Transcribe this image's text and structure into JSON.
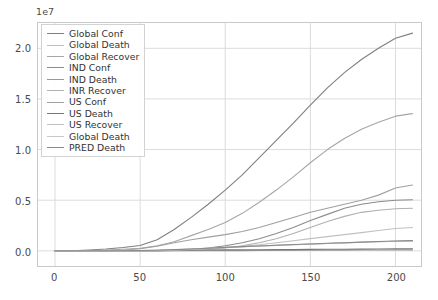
{
  "chart_data": {
    "type": "line",
    "title": "",
    "xlabel": "",
    "ylabel": "",
    "y_offset_label": "1e7",
    "y_offset_value": 10000000,
    "xlim": [
      -10,
      215
    ],
    "ylim": [
      -1500000,
      22500000
    ],
    "xticks": [
      0,
      50,
      100,
      150,
      200
    ],
    "yticks": [
      0.0,
      0.5,
      1.0,
      1.5,
      2.0
    ],
    "ytick_labels": [
      "0.0",
      "0.5",
      "1.0",
      "1.5",
      "2.0"
    ],
    "xtick_labels": [
      "0",
      "50",
      "100",
      "150",
      "200"
    ],
    "grid": true,
    "legend_position": "upper left",
    "x": [
      0,
      10,
      20,
      30,
      40,
      50,
      60,
      70,
      80,
      90,
      100,
      110,
      120,
      130,
      140,
      150,
      160,
      170,
      180,
      190,
      200,
      210
    ],
    "series": [
      {
        "name": "Global Conf",
        "color": "#7f7f7f",
        "values": [
          0,
          5000,
          80000,
          180000,
          320000,
          520000,
          1100000,
          2100000,
          3300000,
          4600000,
          6000000,
          7500000,
          9200000,
          10900000,
          12600000,
          14400000,
          16100000,
          17600000,
          18900000,
          20000000,
          21000000,
          21500000
        ]
      },
      {
        "name": "Global Death",
        "color": "#bdbdbd",
        "values": [
          0,
          200,
          2500,
          6000,
          12000,
          24000,
          55000,
          110000,
          175000,
          250000,
          330000,
          400000,
          470000,
          540000,
          600000,
          660000,
          720000,
          780000,
          840000,
          900000,
          950000,
          980000
        ]
      },
      {
        "name": "Global Recover",
        "color": "#a6a6a6",
        "values": [
          0,
          1000,
          25000,
          70000,
          150000,
          260000,
          500000,
          900000,
          1500000,
          2100000,
          2800000,
          3700000,
          4800000,
          6000000,
          7300000,
          8700000,
          10000000,
          11100000,
          12000000,
          12700000,
          13300000,
          13550000
        ]
      },
      {
        "name": "IND Conf",
        "color": "#8c8c8c",
        "values": [
          0,
          0,
          0,
          100,
          1000,
          5000,
          20000,
          60000,
          140000,
          280000,
          500000,
          800000,
          1200000,
          1700000,
          2300000,
          3000000,
          3600000,
          4200000,
          4600000,
          4850000,
          5000000,
          5050000
        ]
      },
      {
        "name": "IND Death",
        "color": "#999999",
        "values": [
          0,
          0,
          0,
          5,
          30,
          150,
          600,
          1800,
          4000,
          8000,
          15000,
          22000,
          30000,
          37000,
          45000,
          55000,
          63000,
          70000,
          76000,
          79000,
          81000,
          82000
        ]
      },
      {
        "name": "INR Recover",
        "color": "#b0b0b0",
        "values": [
          0,
          0,
          0,
          20,
          120,
          600,
          4000,
          18000,
          60000,
          140000,
          280000,
          500000,
          800000,
          1200000,
          1700000,
          2300000,
          2900000,
          3400000,
          3800000,
          4000000,
          4150000,
          4200000
        ]
      },
      {
        "name": "US Conf",
        "color": "#a0a0a0",
        "values": [
          0,
          0,
          100,
          3000,
          60000,
          200000,
          450000,
          800000,
          1100000,
          1350000,
          1600000,
          1900000,
          2300000,
          2800000,
          3300000,
          3800000,
          4200000,
          4600000,
          5000000,
          5500000,
          6200000,
          6500000
        ]
      },
      {
        "name": "US Death",
        "color": "#777777",
        "values": [
          0,
          0,
          2,
          70,
          900,
          5000,
          18000,
          40000,
          63000,
          78000,
          90000,
          100000,
          112000,
          125000,
          135000,
          145000,
          152000,
          160000,
          170000,
          180000,
          190000,
          195000
        ]
      },
      {
        "name": "US Recover",
        "color": "#c0c0c0",
        "values": [
          0,
          0,
          0,
          30,
          2000,
          10000,
          30000,
          70000,
          140000,
          220000,
          320000,
          450000,
          600000,
          800000,
          1000000,
          1200000,
          1400000,
          1600000,
          1800000,
          2000000,
          2200000,
          2300000
        ]
      },
      {
        "name": "Global Death",
        "color": "#c8c8c8",
        "values": [
          0,
          200,
          2500,
          6000,
          12000,
          24000,
          55000,
          110000,
          175000,
          250000,
          330000,
          400000,
          470000,
          540000,
          600000,
          660000,
          720000,
          780000,
          840000,
          900000,
          950000,
          980000
        ]
      },
      {
        "name": "PRED Death",
        "color": "#8a8a8a",
        "values": [
          0,
          300,
          2700,
          6500,
          13000,
          26000,
          58000,
          115000,
          182000,
          258000,
          340000,
          412000,
          483000,
          555000,
          616000,
          678000,
          740000,
          800000,
          862000,
          924000,
          975000,
          1005000
        ]
      }
    ]
  }
}
